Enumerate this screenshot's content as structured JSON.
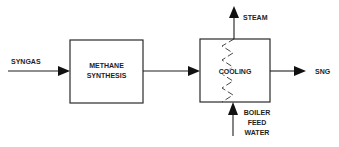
{
  "diagram": {
    "type": "process-flow",
    "nodes": [
      {
        "id": "methane-synthesis",
        "lines": [
          "METHANE",
          "SYNTHESIS"
        ]
      },
      {
        "id": "cooling",
        "lines": [
          "COOLING"
        ]
      }
    ],
    "streams": [
      {
        "id": "syngas",
        "label": "SYNGAS",
        "from": "input",
        "to": "methane-synthesis"
      },
      {
        "id": "synthesis-to-cooling",
        "label": "",
        "from": "methane-synthesis",
        "to": "cooling"
      },
      {
        "id": "steam",
        "label": "STEAM",
        "from": "cooling",
        "to": "output"
      },
      {
        "id": "sng",
        "label": "SNG",
        "from": "cooling",
        "to": "output"
      },
      {
        "id": "bfw",
        "lines": [
          "BOILER",
          "FEED",
          "WATER"
        ],
        "from": "input",
        "to": "cooling"
      }
    ]
  },
  "labels": {
    "syngas": "SYNGAS",
    "methane_line1": "METHANE",
    "methane_line2": "SYNTHESIS",
    "cooling": "COOLING",
    "steam": "STEAM",
    "sng": "SNG",
    "bfw_line1": "BOILER",
    "bfw_line2": "FEED",
    "bfw_line3": "WATER"
  },
  "colors": {
    "stroke": "#1e1e1e",
    "background": "#ffffff"
  }
}
